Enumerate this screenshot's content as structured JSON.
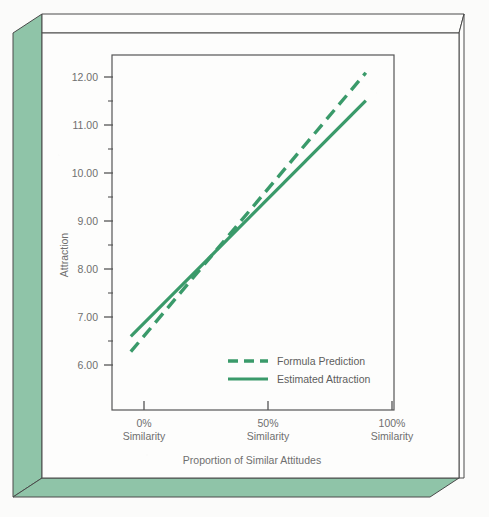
{
  "figure": {
    "background_color": "#fbfbfa",
    "panel_color": "#8fc4a8",
    "line_color": "#3a9a6a",
    "frame_stroke": "#4a4a4a",
    "text_color": "#6f6f6f"
  },
  "chart_data": {
    "type": "line",
    "title": "",
    "xlabel": "Proportion of Similar Attitudes",
    "ylabel": "Attraction",
    "x": [
      0,
      50,
      100
    ],
    "xtick_labels": [
      "0%\nSimilarity",
      "50%\nSimilarity",
      "100%\nSimilarity"
    ],
    "xtick_values": [
      0,
      50,
      100
    ],
    "xlim": [
      -8,
      112
    ],
    "ylim": [
      5.45,
      12.45
    ],
    "ytick_labels": [
      "6.00",
      "7.00",
      "8.00",
      "9.00",
      "10.00",
      "11.00",
      "12.00"
    ],
    "ytick_values": [
      6,
      7,
      8,
      9,
      10,
      11,
      12
    ],
    "yminor_values": [
      6.5,
      7.5,
      8.5,
      9.5,
      10.5,
      11.5
    ],
    "grid": false,
    "legend_position": "lower right",
    "series": [
      {
        "name": "Formula Prediction",
        "style": "dashed",
        "color": "#3a9a6a",
        "x": [
          0,
          100
        ],
        "values": [
          6.6,
          12.1
        ]
      },
      {
        "name": "Estimated Attraction",
        "style": "solid",
        "color": "#3a9a6a",
        "x": [
          0,
          100
        ],
        "values": [
          6.9,
          11.55
        ]
      }
    ],
    "annotations": []
  },
  "axes": {
    "y_axis_title": "Attraction",
    "x_axis_title": "Proportion of Similar Attitudes",
    "y_ticks": [
      {
        "label": "12.00",
        "value": 12
      },
      {
        "label": "11.00",
        "value": 11
      },
      {
        "label": "10.00",
        "value": 10
      },
      {
        "label": "9.00",
        "value": 9
      },
      {
        "label": "8.00",
        "value": 8
      },
      {
        "label": "7.00",
        "value": 7
      },
      {
        "label": "6.00",
        "value": 6
      }
    ],
    "x_ticks": [
      {
        "pct": "0%",
        "sub": "Similarity",
        "value": 0
      },
      {
        "pct": "50%",
        "sub": "Similarity",
        "value": 50
      },
      {
        "pct": "100%",
        "sub": "Similarity",
        "value": 100
      }
    ]
  },
  "legend": {
    "items": [
      {
        "label": "Formula Prediction",
        "style": "dashed"
      },
      {
        "label": "Estimated Attraction",
        "style": "solid"
      }
    ]
  }
}
